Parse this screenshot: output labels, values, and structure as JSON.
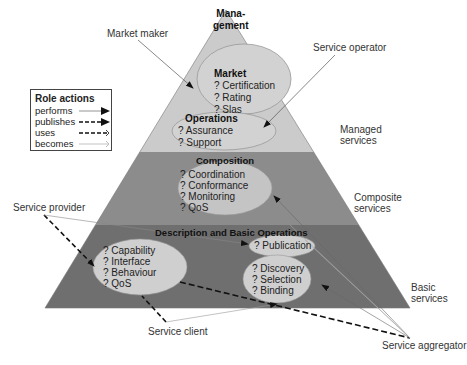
{
  "diagram": {
    "layers": [
      {
        "title": "Mana-\ngement",
        "title_line1": "Mana-",
        "title_line2": "gement",
        "side_label_line1": "Managed",
        "side_label_line2": "services",
        "color": "#cbcbcb"
      },
      {
        "title": "Composition",
        "side_label_line1": "Composite",
        "side_label_line2": "services",
        "color": "#8c8c8c"
      },
      {
        "title": "Description and Basic Operations",
        "side_label_line1": "Basic",
        "side_label_line2": "services",
        "color": "#6f6f6f"
      }
    ],
    "ellipses": {
      "market": {
        "title": "Market",
        "items": [
          "? Certification",
          "? Rating",
          "? Slas"
        ]
      },
      "operations": {
        "title": "Operations",
        "items": [
          "? Assurance",
          "? Support"
        ]
      },
      "composition": {
        "items": [
          "? Coordination",
          "? Conformance",
          "? Monitoring",
          "? QoS"
        ]
      },
      "description": {
        "items": [
          "? Capability",
          "? Interface",
          "? Behaviour",
          "? QoS"
        ]
      },
      "publication": {
        "items": [
          "? Publication"
        ]
      },
      "discovery": {
        "items": [
          "? Discovery",
          "? Selection",
          "? Binding"
        ]
      }
    },
    "ellipse_color": "#d2d2d2",
    "roles": {
      "market_maker": "Market maker",
      "service_operator": "Service operator",
      "service_provider": "Service provider",
      "service_client": "Service client",
      "service_aggregator": "Service aggregator"
    },
    "legend": {
      "title": "Role actions",
      "rows": [
        {
          "label": "performs",
          "style": "thin-solid-filled-arrow"
        },
        {
          "label": "publishes",
          "style": "dashed-filled-arrow"
        },
        {
          "label": "uses",
          "style": "dashed-open-arrow"
        },
        {
          "label": "becomes",
          "style": "thin-solid-open-arrow"
        }
      ]
    }
  }
}
